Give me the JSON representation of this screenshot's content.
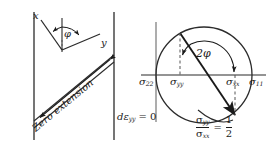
{
  "figure": {
    "background_color": "#ffffff",
    "line_color": "#1a1a1a",
    "width": 275,
    "height": 152
  },
  "left_diagram": {
    "name": "zero-extension-diagram",
    "axis_x_label": "x",
    "axis_y_label": "y",
    "angle_label": "φ",
    "band_label": "Zero extension",
    "condition_label": {
      "d": "d",
      "epsilon": "ε",
      "subscript": "yy",
      "equals": "= 0"
    }
  },
  "right_diagram": {
    "name": "mohr-circle-diagram",
    "angle_label": "2φ",
    "axis_labels": {
      "sigma22": {
        "symbol": "σ",
        "sub": "22"
      },
      "sigma_yy": {
        "symbol": "σ",
        "sub": "yy"
      },
      "sigma_xx": {
        "symbol": "σ",
        "sub": "xx"
      },
      "sigma11": {
        "symbol": "σ",
        "sub": "11"
      },
      "sigma_yy_lower": {
        "symbol": "σ",
        "sub": "yy"
      }
    },
    "ratio": {
      "numerator_symbol": "σ",
      "numerator_sub": "yy",
      "denominator_symbol": "σ",
      "denominator_sub": "xx",
      "equals": "=",
      "value_numerator": "1",
      "value_denominator": "2"
    }
  }
}
